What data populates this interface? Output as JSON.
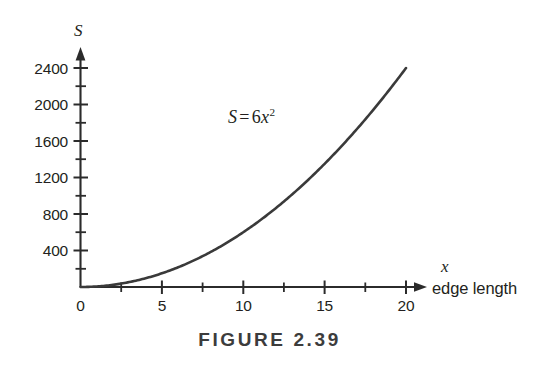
{
  "figure": {
    "caption": "FIGURE 2.39"
  },
  "chart_data": {
    "type": "line",
    "title": "",
    "subtitle": "",
    "equation_label": {
      "lhs": "S",
      "operator": "=",
      "coefficient": "6",
      "variable": "x",
      "exponent": "2",
      "plain": "S = 6x²"
    },
    "xlabel": "x",
    "xlabel_description": "edge length",
    "ylabel": "S",
    "ylabel_description": "",
    "xlim": [
      0,
      21.3
    ],
    "ylim": [
      0,
      2600
    ],
    "x_ticks_major": [
      0,
      5,
      10,
      15,
      20
    ],
    "x_tick_labels": [
      "0",
      "5",
      "10",
      "15",
      "20"
    ],
    "x_ticks_minor": [
      2.5,
      7.5,
      12.5,
      17.5
    ],
    "y_ticks_major": [
      400,
      800,
      1200,
      1600,
      2000,
      2400
    ],
    "y_tick_labels": [
      "400",
      "800",
      "1200",
      "1600",
      "2000",
      "2400"
    ],
    "y_ticks_minor": [
      200,
      600,
      1000,
      1400,
      1800,
      2200
    ],
    "grid": false,
    "legend": false,
    "series": [
      {
        "name": "S = 6x^2",
        "color": "#3a3a3a",
        "x": [
          0,
          1,
          2,
          3,
          4,
          5,
          6,
          7,
          8,
          9,
          10,
          11,
          12,
          13,
          14,
          15,
          16,
          17,
          18,
          19,
          20
        ],
        "values": [
          0,
          6,
          24,
          54,
          96,
          150,
          216,
          294,
          384,
          486,
          600,
          726,
          864,
          1014,
          1176,
          1350,
          1536,
          1734,
          1944,
          2166,
          2400
        ]
      }
    ],
    "axis_arrows": [
      "x-positive",
      "y-positive"
    ],
    "colors": {
      "curve": "#3a3a3a",
      "axis": "#2b2b2b",
      "text": "#231f20",
      "caption": "#3c3c3c",
      "background": "#ffffff"
    }
  }
}
